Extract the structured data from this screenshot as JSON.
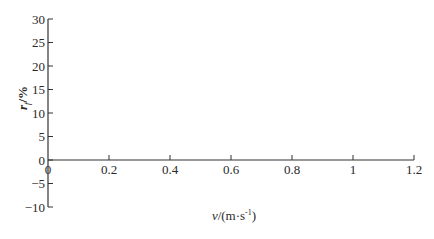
{
  "chart_data": {
    "type": "line",
    "title": "",
    "xlabel": "v/(m·s⁻¹)",
    "xlabel_parts": {
      "var": "v",
      "rest": "/(m·s",
      "sup": "-1",
      "close": ")"
    },
    "ylabel": "r_f/%",
    "ylabel_parts": {
      "var": "r",
      "sub": "f",
      "rest": "/%"
    },
    "xlim": [
      0,
      1.2
    ],
    "ylim": [
      -10,
      30
    ],
    "x_ticks": [
      "0",
      "0.2",
      "0.4",
      "0.6",
      "0.8",
      "1",
      "1.2"
    ],
    "y_ticks": [
      "30",
      "25",
      "20",
      "15",
      "10",
      "5",
      "0",
      "-5",
      "-10"
    ],
    "grid": false,
    "legend": null,
    "series": []
  }
}
